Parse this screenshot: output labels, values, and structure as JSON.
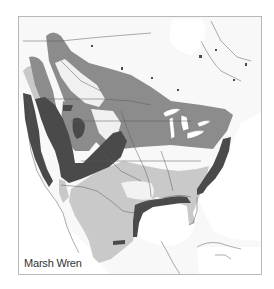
{
  "map": {
    "title": "Marsh Wren",
    "region": "North America",
    "colors": {
      "land": "#f7f7f7",
      "water": "#ffffff",
      "border": "#5a5a5a",
      "year_round": "#4a4a4a",
      "breeding": "#8c8c8c",
      "winter": "#c9c9c9"
    },
    "legend": [
      {
        "key": "year_round",
        "label": ""
      },
      {
        "key": "breeding",
        "label": ""
      },
      {
        "key": "winter",
        "label": ""
      }
    ]
  }
}
